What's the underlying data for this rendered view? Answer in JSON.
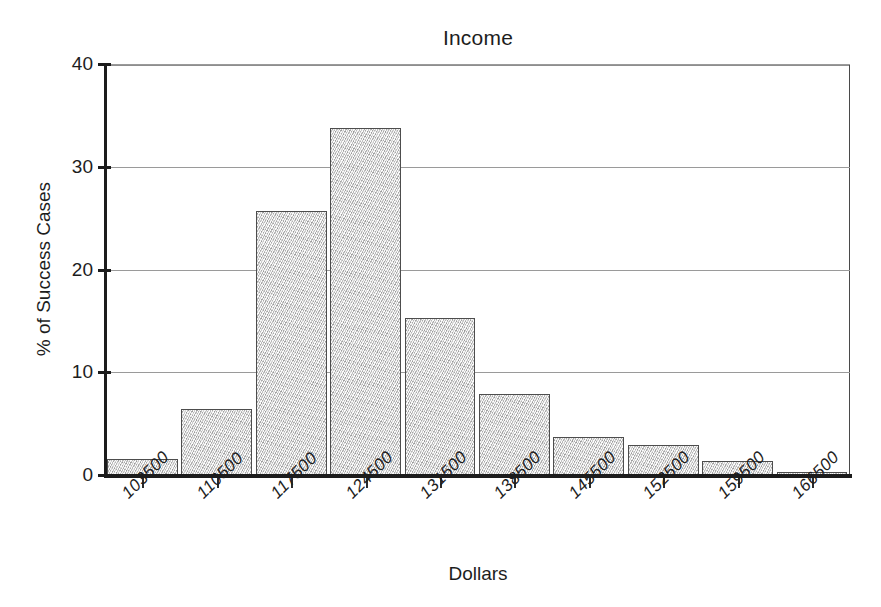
{
  "chart_data": {
    "type": "bar",
    "title": "Income",
    "xlabel": "Dollars",
    "ylabel": "% of Success Cases",
    "categories": [
      "103500",
      "110500",
      "117500",
      "124500",
      "131500",
      "138500",
      "145500",
      "152500",
      "159500",
      "166500"
    ],
    "values": [
      1.6,
      6.4,
      25.7,
      33.8,
      15.3,
      7.9,
      3.7,
      2.9,
      1.4,
      0.3
    ],
    "ylim": [
      0,
      40
    ],
    "yticks": [
      "0",
      "10",
      "20",
      "30",
      "40"
    ],
    "ytick_values": [
      0,
      10,
      20,
      30,
      40
    ],
    "grid": "horizontal",
    "legend": "none",
    "bar_style": "contiguous-histogram-stippled-gray",
    "bar_fill_color": "#dcdcdc",
    "bar_border_color": "#4d4d4d",
    "axis_color": "#1c1c1c",
    "gridline_color": "#9a9a9a",
    "background_color": "#ffffff",
    "xtick_label_rotation": -45
  }
}
